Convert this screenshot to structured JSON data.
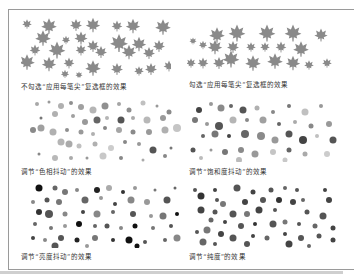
{
  "figure": {
    "panels": [
      {
        "id": "leaf-off",
        "caption": "不勾选“应用每笔尖”复选框的效果",
        "kind": "leaves",
        "color": "#8a8a8a"
      },
      {
        "id": "leaf-on",
        "caption": "勾选“应用每笔尖”复选框的效果",
        "kind": "leaves",
        "color": "#8a8a8a"
      },
      {
        "id": "hue-jitter",
        "caption": "调节“色相抖动”的效果",
        "kind": "dots"
      },
      {
        "id": "saturation-jitter",
        "caption": "调节“饱和度抖动”的效果",
        "kind": "dots"
      },
      {
        "id": "brightness-jitter",
        "caption": "调节“亮度抖动”的效果",
        "kind": "dots"
      },
      {
        "id": "purity",
        "caption": "调节“纯度”的效果",
        "kind": "dots"
      }
    ],
    "colors": {
      "border": "#9a9a9a",
      "leaf": "#8c8c8c",
      "dot_light": "#c4c4c4",
      "dot_mid": "#8f8f8f",
      "dot_dark": "#3a3a3a",
      "caption": "#333333"
    }
  }
}
